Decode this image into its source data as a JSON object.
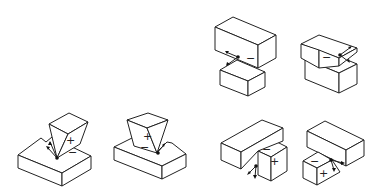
{
  "diagram": {
    "figures": [
      {
        "id": "fig1",
        "position": "bottom-left",
        "upper_label": "+",
        "lower_label": "−"
      },
      {
        "id": "fig2",
        "position": "bottom-second",
        "upper_label": "+",
        "lower_label": "−"
      },
      {
        "id": "fig3",
        "position": "top-right-left",
        "upper_label": "",
        "lower_label": "−"
      },
      {
        "id": "fig4",
        "position": "top-right-right",
        "upper_label": "",
        "lower_label": "−"
      },
      {
        "id": "fig5",
        "position": "bottom-right-left",
        "upper_label": "−",
        "lower_label": "+"
      },
      {
        "id": "fig6",
        "position": "bottom-right-right",
        "upper_label": "−",
        "lower_label": "+"
      }
    ],
    "colors": {
      "line": "#222222",
      "fill": "#ffffff"
    }
  }
}
